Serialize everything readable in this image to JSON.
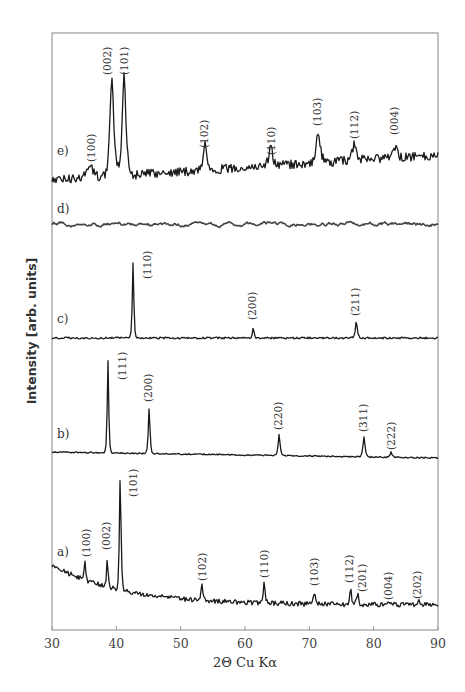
{
  "chart_data": {
    "type": "line",
    "title": "",
    "xlabel": "2Θ Cu Kα",
    "ylabel": "Intensity [arb. units]",
    "xlim": [
      30,
      90
    ],
    "x_ticks": [
      30,
      40,
      50,
      60,
      70,
      80,
      90
    ],
    "grid": false,
    "legend": "none (series labeled inline a)–e))",
    "series": [
      {
        "name": "e)",
        "baseline_px": {
          "start": 180,
          "end": 155
        },
        "noise": 4.5,
        "peaks": [
          {
            "hkl": "(100)",
            "two_theta": 35.9,
            "height": 12,
            "width": 0.9
          },
          {
            "hkl": "(002)",
            "two_theta": 39.3,
            "height": 99,
            "width": 0.55
          },
          {
            "hkl": "(101)",
            "two_theta": 41.2,
            "height": 99,
            "width": 0.55
          },
          {
            "hkl": "(102)",
            "two_theta": 53.8,
            "height": 28,
            "width": 0.5
          },
          {
            "hkl": "(110)",
            "two_theta": 64.0,
            "height": 18,
            "width": 0.6
          },
          {
            "hkl": "(103)",
            "two_theta": 71.4,
            "height": 30,
            "width": 0.6
          },
          {
            "hkl": "(112)",
            "two_theta": 77.0,
            "height": 16,
            "width": 0.7
          },
          {
            "hkl": "(004)",
            "two_theta": 83.3,
            "height": 10,
            "width": 0.6
          }
        ]
      },
      {
        "name": "d)",
        "baseline_px": {
          "start": 224,
          "end": 224
        },
        "noise": 2.2,
        "peaks": []
      },
      {
        "name": "c)",
        "baseline_px": {
          "start": 338,
          "end": 338
        },
        "noise": 0.9,
        "peaks": [
          {
            "hkl": "(110)",
            "two_theta": 42.6,
            "height": 75,
            "width": 0.22
          },
          {
            "hkl": "(200)",
            "two_theta": 61.3,
            "height": 10,
            "width": 0.25
          },
          {
            "hkl": "(211)",
            "two_theta": 77.3,
            "height": 16,
            "width": 0.3
          }
        ]
      },
      {
        "name": "b)",
        "baseline_px": {
          "start": 452,
          "end": 458
        },
        "noise": 0.6,
        "peaks": [
          {
            "hkl": "(111)",
            "two_theta": 38.7,
            "height": 92,
            "width": 0.22
          },
          {
            "hkl": "(200)",
            "two_theta": 45.1,
            "height": 46,
            "width": 0.24
          },
          {
            "hkl": "(220)",
            "two_theta": 65.3,
            "height": 21,
            "width": 0.28
          },
          {
            "hkl": "(311)",
            "two_theta": 78.5,
            "height": 20,
            "width": 0.3
          },
          {
            "hkl": "(222)",
            "two_theta": 82.7,
            "height": 5,
            "width": 0.3
          }
        ]
      },
      {
        "name": "a)",
        "baseline_px": {
          "start": 565,
          "end": 605
        },
        "baseline_decay": true,
        "noise": 2.4,
        "peaks": [
          {
            "hkl": "(100)",
            "two_theta": 35.1,
            "height": 22,
            "width": 0.22
          },
          {
            "hkl": "(002)",
            "two_theta": 38.6,
            "height": 30,
            "width": 0.22
          },
          {
            "hkl": "(101)",
            "two_theta": 40.6,
            "height": 115,
            "width": 0.24
          },
          {
            "hkl": "(102)",
            "two_theta": 53.3,
            "height": 17,
            "width": 0.26
          },
          {
            "hkl": "(110)",
            "two_theta": 63.0,
            "height": 21,
            "width": 0.26
          },
          {
            "hkl": "(103)",
            "two_theta": 70.8,
            "height": 14,
            "width": 0.28
          },
          {
            "hkl": "(112)",
            "two_theta": 76.4,
            "height": 17,
            "width": 0.26
          },
          {
            "hkl": "(201)",
            "two_theta": 77.5,
            "height": 12,
            "width": 0.26
          },
          {
            "hkl": "(004)",
            "two_theta": 82.4,
            "height": 4,
            "width": 0.3
          },
          {
            "hkl": "(202)",
            "two_theta": 87.0,
            "height": 4,
            "width": 0.3
          }
        ]
      }
    ]
  },
  "labels": {
    "series": [
      {
        "text": "e)",
        "x": 57,
        "y": 155
      },
      {
        "text": "d)",
        "x": 57,
        "y": 213
      },
      {
        "text": "c)",
        "x": 57,
        "y": 323
      },
      {
        "text": "b)",
        "x": 57,
        "y": 438
      },
      {
        "text": "a)",
        "x": 57,
        "y": 556
      }
    ],
    "peaks": [
      {
        "text": "(100)",
        "x": 95,
        "y": 162
      },
      {
        "text": "(002)",
        "x": 111,
        "y": 75
      },
      {
        "text": "(101)",
        "x": 128,
        "y": 75
      },
      {
        "text": "(102)",
        "x": 208,
        "y": 148
      },
      {
        "text": "(110)",
        "x": 275,
        "y": 155
      },
      {
        "text": "(103)",
        "x": 321,
        "y": 126
      },
      {
        "text": "(112)",
        "x": 358,
        "y": 139
      },
      {
        "text": "(004)",
        "x": 398,
        "y": 135
      },
      {
        "text": "(110)",
        "x": 151,
        "y": 279
      },
      {
        "text": "(200)",
        "x": 256,
        "y": 320
      },
      {
        "text": "(211)",
        "x": 359,
        "y": 316
      },
      {
        "text": "(111)",
        "x": 126,
        "y": 380
      },
      {
        "text": "(200)",
        "x": 152,
        "y": 402
      },
      {
        "text": "(220)",
        "x": 282,
        "y": 430
      },
      {
        "text": "(311)",
        "x": 367,
        "y": 432
      },
      {
        "text": "(222)",
        "x": 395,
        "y": 450
      },
      {
        "text": "(100)",
        "x": 90,
        "y": 557
      },
      {
        "text": "(002)",
        "x": 110,
        "y": 550
      },
      {
        "text": "(101)",
        "x": 137,
        "y": 497
      },
      {
        "text": "(102)",
        "x": 206,
        "y": 581
      },
      {
        "text": "(110)",
        "x": 268,
        "y": 578
      },
      {
        "text": "(103)",
        "x": 318,
        "y": 586
      },
      {
        "text": "(112)",
        "x": 353,
        "y": 583
      },
      {
        "text": "(201)",
        "x": 366,
        "y": 592
      },
      {
        "text": "(004)",
        "x": 392,
        "y": 600
      },
      {
        "text": "(202)",
        "x": 421,
        "y": 599
      }
    ]
  },
  "axes": {
    "x_title": "2Θ Cu Kα",
    "y_title": "Intensity [arb. units]",
    "tick_labels": [
      "30",
      "40",
      "50",
      "60",
      "70",
      "80",
      "90"
    ]
  },
  "colors": {
    "curve": "#1a1a1a",
    "frame": "#9a9a9a",
    "text": "#333333"
  }
}
